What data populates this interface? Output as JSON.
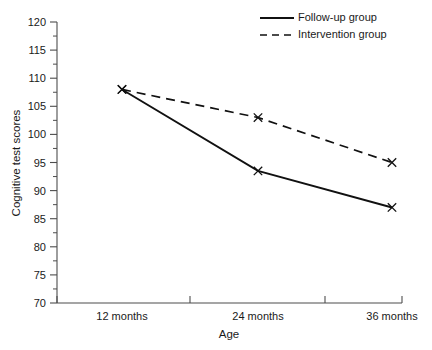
{
  "chart_data": {
    "type": "line",
    "title": "",
    "xlabel": "Age",
    "ylabel": "Cognitive test scores",
    "categories": [
      "12 months",
      "24 months",
      "36 months"
    ],
    "ylim": [
      70,
      120
    ],
    "ytick_step": 5,
    "yticks": [
      70,
      75,
      80,
      85,
      90,
      95,
      100,
      105,
      110,
      115,
      120
    ],
    "ytick_labels": [
      "70",
      "75",
      "80",
      "85",
      "90",
      "95",
      "100",
      "105",
      "110",
      "115",
      "120"
    ],
    "grid": false,
    "legend_position": "top-right",
    "marker": "x",
    "series": [
      {
        "name": "Follow-up group",
        "style": "solid",
        "values": [
          108,
          93.5,
          87
        ]
      },
      {
        "name": "Intervention group",
        "style": "dashed",
        "values": [
          108,
          103,
          95
        ]
      }
    ]
  },
  "legend": {
    "items": [
      {
        "label": "Follow-up group",
        "style": "solid"
      },
      {
        "label": "Intervention group",
        "style": "dashed"
      }
    ]
  }
}
